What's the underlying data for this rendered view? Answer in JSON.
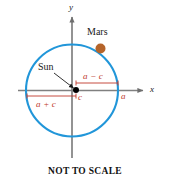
{
  "figure": {
    "caption": "NOT TO SCALE",
    "axes": {
      "x_label": "x",
      "y_label": "y",
      "axis_color": "#808080"
    },
    "orbit": {
      "color": "#2196d9",
      "stroke_width": 2.1,
      "center_x": 72,
      "center_y": 90.5,
      "radius": 46
    },
    "bodies": [
      {
        "name": "Sun",
        "label": "Sun",
        "color": "#000000",
        "x": 76,
        "y": 90,
        "radius": 3
      },
      {
        "name": "Mars",
        "label": "Mars",
        "color": "#b5642a",
        "x": 100.5,
        "y": 48.5,
        "radius": 5
      }
    ],
    "measures": [
      {
        "id": "a-minus-c",
        "label": "a − c",
        "color": "#c0392b",
        "from_x": 76,
        "to_x": 118,
        "y": 83
      },
      {
        "id": "a-plus-c",
        "label": "a + c",
        "color": "#c0392b",
        "from_x": 27,
        "to_x": 76,
        "y": 96
      }
    ],
    "markers": [
      {
        "id": "semi-major-a",
        "label": "a",
        "color": "#c0392b"
      },
      {
        "id": "focal-c",
        "label": "c",
        "color": "#c0392b"
      }
    ]
  }
}
